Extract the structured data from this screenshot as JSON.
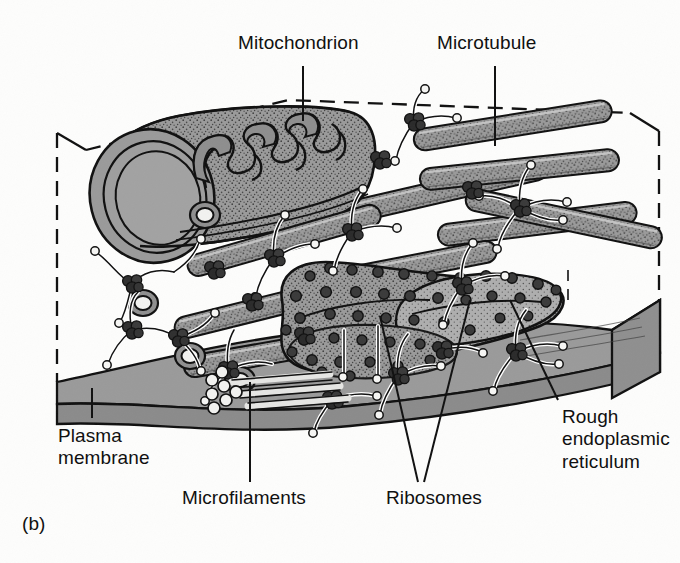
{
  "figure": {
    "panel_label": "(b)",
    "background_color": "#fdfdfc",
    "ink_color": "#101010",
    "fill_gray_mid": "#949494",
    "fill_gray_light": "#b4b4b4",
    "fill_gray_dark": "#6f6f6f",
    "ribosome_color": "#3a3a3a",
    "box_style": "dashed-outline-cutaway-cube"
  },
  "labels": [
    {
      "id": "mitochondrion",
      "text": "Mitochondrion",
      "leader": "vertical-line-down"
    },
    {
      "id": "microtubule",
      "text": "Microtubule",
      "leader": "vertical-line-down"
    },
    {
      "id": "plasma_membrane",
      "text": "Plasma\nmembrane",
      "leader": "vertical-line-up"
    },
    {
      "id": "microfilaments",
      "text": "Microfilaments",
      "leader": "vertical-line-up"
    },
    {
      "id": "ribosomes",
      "text": "Ribosomes",
      "leader": "two-converging-lines-up"
    },
    {
      "id": "rough_er",
      "text": "Rough\nendoplasmic\nreticulum",
      "leader": "diagonal-line-up-left"
    }
  ],
  "structures": [
    {
      "name": "mitochondrion",
      "description": "large cut-open capsule, upper left, stippled matrix with folded cristae",
      "count": 1
    },
    {
      "name": "microtubule",
      "description": "long stippled gray cylinders crossing the cytoplasm, some shown in cross-section as rings",
      "count": 9
    },
    {
      "name": "microfilament",
      "description": "thin white filaments radiating between junction complexes",
      "count": 40
    },
    {
      "name": "junction-complex",
      "description": "dark clustered nodes where filaments meet",
      "count": 18
    },
    {
      "name": "rough-endoplasmic-reticulum",
      "description": "flattened stippled sac, lower right centre, studded with ribosomes",
      "count": 1
    },
    {
      "name": "ribosome",
      "description": "dark circular dots on the ER surface",
      "count": 44
    },
    {
      "name": "plasma-membrane",
      "description": "thick gray slab forming the floor of the block",
      "count": 1
    },
    {
      "name": "microfilament-bundle",
      "description": "bundle of parallel filaments with rosette of circles at free end, bottom centre",
      "count": 1
    }
  ]
}
